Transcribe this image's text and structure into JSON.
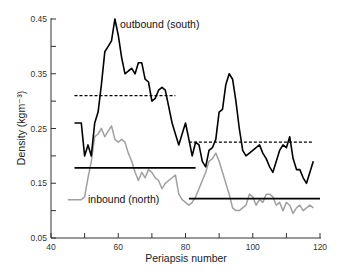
{
  "chart_data": {
    "type": "line",
    "title": "",
    "xlabel": "Periapsis number",
    "ylabel": "Density (kgm⁻³)",
    "xlim": [
      40,
      120
    ],
    "ylim": [
      0.05,
      0.45
    ],
    "xticks": [
      40,
      60,
      80,
      100,
      120
    ],
    "xtick_labels": [
      "40",
      "60",
      "80",
      "100",
      "120"
    ],
    "yticks": [
      0.05,
      0.15,
      0.25,
      0.35,
      0.45
    ],
    "ytick_labels": [
      "0.05",
      "0.15",
      "0.25",
      "0.35",
      "0.45"
    ],
    "grid": false,
    "legend": "none",
    "annotations": [
      {
        "text": "outbound (south)",
        "x": 60.5,
        "y": 0.44
      },
      {
        "text": "inbound (north)",
        "x": 51.5,
        "y": 0.115
      }
    ],
    "series": [
      {
        "name": "outbound (south)",
        "color": "#000000",
        "style": "solid",
        "x": [
          47,
          49,
          50,
          51,
          52,
          53,
          54,
          55,
          56,
          57,
          58,
          59,
          60,
          61,
          62,
          63,
          64,
          65,
          66,
          67,
          68,
          69,
          70,
          71,
          72,
          73,
          74,
          75,
          76,
          77,
          78,
          79,
          80,
          81,
          82,
          83,
          84,
          85,
          86,
          87,
          88,
          89,
          90,
          91,
          92,
          93,
          94,
          95,
          96,
          97,
          98,
          99,
          100,
          101,
          102,
          103,
          104,
          105,
          106,
          107,
          108,
          109,
          110,
          111,
          112,
          113,
          114,
          115,
          116,
          117,
          118
        ],
        "y": [
          0.26,
          0.26,
          0.2,
          0.22,
          0.2,
          0.26,
          0.28,
          0.33,
          0.39,
          0.4,
          0.41,
          0.45,
          0.42,
          0.38,
          0.35,
          0.355,
          0.36,
          0.35,
          0.37,
          0.37,
          0.34,
          0.335,
          0.3,
          0.305,
          0.32,
          0.325,
          0.32,
          0.29,
          0.26,
          0.24,
          0.22,
          0.24,
          0.26,
          0.23,
          0.2,
          0.225,
          0.22,
          0.19,
          0.18,
          0.21,
          0.215,
          0.23,
          0.28,
          0.285,
          0.33,
          0.35,
          0.34,
          0.3,
          0.25,
          0.21,
          0.2,
          0.205,
          0.21,
          0.215,
          0.22,
          0.205,
          0.195,
          0.18,
          0.17,
          0.19,
          0.21,
          0.22,
          0.215,
          0.235,
          0.195,
          0.175,
          0.175,
          0.16,
          0.15,
          0.17,
          0.19
        ]
      },
      {
        "name": "inbound (north)",
        "color": "#a0a0a0",
        "style": "solid",
        "x": [
          45,
          47,
          49,
          50,
          51,
          52,
          53,
          54,
          55,
          56,
          57,
          58,
          59,
          60,
          61,
          62,
          63,
          64,
          65,
          66,
          67,
          68,
          69,
          70,
          71,
          72,
          73,
          74,
          75,
          76,
          77,
          78,
          79,
          80,
          81,
          82,
          83,
          84,
          85,
          86,
          87,
          88,
          89,
          90,
          91,
          92,
          93,
          94,
          95,
          96,
          97,
          98,
          99,
          100,
          101,
          102,
          103,
          104,
          105,
          106,
          107,
          108,
          109,
          110,
          111,
          112,
          113,
          114,
          115,
          116,
          117,
          118
        ],
        "y": [
          0.12,
          0.12,
          0.12,
          0.125,
          0.16,
          0.19,
          0.235,
          0.24,
          0.25,
          0.235,
          0.245,
          0.255,
          0.23,
          0.225,
          0.23,
          0.225,
          0.205,
          0.19,
          0.17,
          0.155,
          0.17,
          0.16,
          0.175,
          0.17,
          0.16,
          0.155,
          0.14,
          0.15,
          0.155,
          0.16,
          0.165,
          0.13,
          0.12,
          0.115,
          0.11,
          0.115,
          0.125,
          0.14,
          0.155,
          0.17,
          0.19,
          0.195,
          0.205,
          0.19,
          0.17,
          0.15,
          0.13,
          0.105,
          0.1,
          0.1,
          0.105,
          0.11,
          0.13,
          0.125,
          0.11,
          0.12,
          0.115,
          0.13,
          0.13,
          0.125,
          0.11,
          0.115,
          0.1,
          0.115,
          0.11,
          0.095,
          0.105,
          0.11,
          0.1,
          0.105,
          0.11,
          0.105
        ]
      },
      {
        "name": "outbound mean (periapsis 47-77)",
        "color": "#000000",
        "style": "dashed",
        "x": [
          47,
          77
        ],
        "y": [
          0.31,
          0.31
        ]
      },
      {
        "name": "outbound mean (periapsis 81-118)",
        "color": "#000000",
        "style": "dashed",
        "x": [
          81,
          118
        ],
        "y": [
          0.225,
          0.225
        ]
      },
      {
        "name": "inbound mean (periapsis 47-83)",
        "color": "#000000",
        "style": "solid-thick",
        "x": [
          47,
          83
        ],
        "y": [
          0.178,
          0.178
        ]
      },
      {
        "name": "inbound mean (periapsis 81-120)",
        "color": "#000000",
        "style": "solid-thick",
        "x": [
          81,
          120
        ],
        "y": [
          0.122,
          0.122
        ]
      }
    ]
  }
}
